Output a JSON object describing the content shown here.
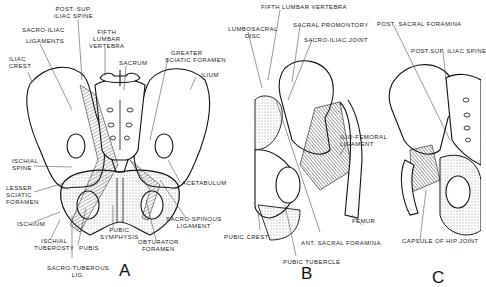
{
  "figure": {
    "panels": [
      {
        "id": "A",
        "letter": "A",
        "labels": [
          "POST. SUP. ILIAC SPINE",
          "SACRO-ILIAC LIGAMENTS",
          "FIFTH LUMBAR VERTEBRA",
          "ILIAC CREST",
          "SACRUM",
          "GREATER SCIATIC FORAMEN",
          "ILIUM",
          "ISCHIAL SPINE",
          "LESSER SCIATIC FORAMEN",
          "ACETABULUM",
          "ISCHIUM",
          "ISCHIAL TUBEROSTY",
          "PUBIS",
          "PUBIC SYMPHYSIS",
          "SACRO-SPINOUS LIGAMENT",
          "OBTURATOR FORAMEN",
          "SACRO-TUBEROUS LIG."
        ]
      },
      {
        "id": "B",
        "letter": "B",
        "labels": [
          "FIFTH LUMBAR VERTEBRA",
          "LUMBOSACRAL DISC",
          "SACRAL PROMONTORY",
          "SACRO-ILIAC JOINT",
          "ILIO-FEMORAL LIGAMENT",
          "FEMUR",
          "PUBIC CREST",
          "ANT. SACRAL FORAMINA",
          "PUBIC TUBERCLE"
        ]
      },
      {
        "id": "C",
        "letter": "C",
        "labels": [
          "POST. SACRAL FORAMINA",
          "POST. SUP. ILIAC SPINE",
          "CAPSULE OF HIP JOINT"
        ]
      }
    ]
  },
  "text": {
    "a_post_sup_1": "POST. SUP.",
    "a_post_sup_2": "ILIAC SPINE",
    "a_si_lig_1": "SACRO-ILIAC",
    "a_si_lig_2": "LIGAMENTS",
    "a_fifth_1": "FIFTH",
    "a_fifth_2": "LUMBAR",
    "a_fifth_3": "VERTEBRA",
    "a_iliac_crest_1": "ILIAC",
    "a_iliac_crest_2": "CREST",
    "a_sacrum": "SACRUM",
    "a_gsf_1": "GREATER",
    "a_gsf_2": "SCIATIC FORAMEN",
    "a_ilium": "ILIUM",
    "a_isch_spine_1": "ISCHIAL",
    "a_isch_spine_2": "SPINE",
    "a_lsf_1": "LESSER",
    "a_lsf_2": "SCIATIC",
    "a_lsf_3": "FORAMEN",
    "a_acetabulum": "ACETABULUM",
    "a_ischium": "ISCHIUM",
    "a_isch_tub_1": "ISCHIAL",
    "a_isch_tub_2": "TUBEROSTY",
    "a_pubis": "PUBIS",
    "a_pub_sym_1": "PUBIC",
    "a_pub_sym_2": "SYMPHYSIS",
    "a_ss_lig_1": "SACRO-SPINOUS",
    "a_ss_lig_2": "LIGAMENT",
    "a_obt_1": "OBTURATOR",
    "a_obt_2": "FORAMEN",
    "a_st_lig_1": "SACRO-TUBEROUS",
    "a_st_lig_2": "LIG.",
    "b_fifth": "FIFTH LUMBAR VERTEBRA",
    "b_lsd_1": "LUMBOSACRAL",
    "b_lsd_2": "DISC",
    "b_promontory": "SACRAL PROMONTORY",
    "b_si_joint": "SACRO-ILIAC JOINT",
    "b_ifl_1": "ILIO-FEMORAL",
    "b_ifl_2": "LIGAMENT",
    "b_femur": "FEMUR",
    "b_pubic_crest": "PUBIC CREST",
    "b_ant_sacral": "ANT. SACRAL FORAMINA",
    "b_pubic_tubercle": "PUBIC TUBERCLE",
    "c_post_sacral": "POST. SACRAL FORAMINA",
    "c_post_sup": "POST.SUP. ILIAC SPINE",
    "c_capsule": "CAPSULE OF HIP JOINT",
    "letter_a": "A",
    "letter_b": "B",
    "letter_c": "C"
  }
}
